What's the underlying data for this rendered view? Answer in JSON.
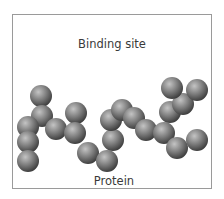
{
  "diagram": {
    "top_label": "Binding site",
    "bottom_label": "Protein",
    "colors": {
      "border": "#9a9a9a",
      "sphere_light": "#c4c4c4",
      "sphere_mid": "#7a7a7a",
      "sphere_dark": "#3c3c3c",
      "text": "#3a3a3a"
    },
    "spheres": [
      {
        "x": 41,
        "y": 96,
        "r": 11
      },
      {
        "x": 42,
        "y": 116,
        "r": 11
      },
      {
        "x": 28,
        "y": 127,
        "r": 11
      },
      {
        "x": 28,
        "y": 142,
        "r": 11
      },
      {
        "x": 28,
        "y": 161,
        "r": 11
      },
      {
        "x": 56,
        "y": 129,
        "r": 11
      },
      {
        "x": 76,
        "y": 113,
        "r": 11
      },
      {
        "x": 75,
        "y": 133,
        "r": 11
      },
      {
        "x": 88,
        "y": 153,
        "r": 11
      },
      {
        "x": 107,
        "y": 161,
        "r": 11
      },
      {
        "x": 113,
        "y": 140,
        "r": 11
      },
      {
        "x": 111,
        "y": 120,
        "r": 11
      },
      {
        "x": 122,
        "y": 110,
        "r": 11
      },
      {
        "x": 134,
        "y": 118,
        "r": 11
      },
      {
        "x": 146,
        "y": 130,
        "r": 11
      },
      {
        "x": 164,
        "y": 133,
        "r": 11
      },
      {
        "x": 177,
        "y": 148,
        "r": 11
      },
      {
        "x": 197,
        "y": 140,
        "r": 11
      },
      {
        "x": 170,
        "y": 112,
        "r": 11
      },
      {
        "x": 183,
        "y": 104,
        "r": 11
      },
      {
        "x": 172,
        "y": 88,
        "r": 11
      },
      {
        "x": 197,
        "y": 90,
        "r": 11
      }
    ]
  }
}
